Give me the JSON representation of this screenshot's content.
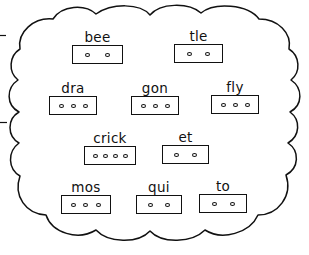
{
  "worksheet": {
    "title": "Word Parts Cloud Worksheet",
    "shape": "cloud-outline",
    "outline_color": "#111111",
    "background_color": "#ffffff",
    "ink_color": "#111111"
  },
  "margin_marks": [
    {
      "name": "left-margin-tick-upper",
      "x": 0,
      "y": 35,
      "width": 6,
      "height": 1
    },
    {
      "name": "left-margin-tick-lower",
      "x": 0,
      "y": 122,
      "width": 7,
      "height": 1
    }
  ],
  "rows": [
    {
      "name": "row-1",
      "cards": [
        {
          "label": "bee",
          "dots": 2,
          "x": 72,
          "y": 30,
          "box_width": 51
        },
        {
          "label": "tle",
          "dots": 2,
          "x": 174,
          "y": 29,
          "box_width": 49
        }
      ]
    },
    {
      "name": "row-2",
      "cards": [
        {
          "label": "dra",
          "dots": 3,
          "x": 49,
          "y": 81,
          "box_width": 48
        },
        {
          "label": "gon",
          "dots": 3,
          "x": 131,
          "y": 81,
          "box_width": 48
        },
        {
          "label": "fly",
          "dots": 3,
          "x": 211,
          "y": 80,
          "box_width": 48
        }
      ]
    },
    {
      "name": "row-3",
      "cards": [
        {
          "label": "crick",
          "dots": 4,
          "x": 84,
          "y": 131,
          "box_width": 52
        },
        {
          "label": "et",
          "dots": 2,
          "x": 162,
          "y": 130,
          "box_width": 47
        }
      ]
    },
    {
      "name": "row-4",
      "cards": [
        {
          "label": "mos",
          "dots": 3,
          "x": 61,
          "y": 180,
          "box_width": 50
        },
        {
          "label": "qui",
          "dots": 2,
          "x": 136,
          "y": 180,
          "box_width": 46
        },
        {
          "label": "to",
          "dots": 2,
          "x": 199,
          "y": 179,
          "box_width": 48
        }
      ]
    }
  ]
}
